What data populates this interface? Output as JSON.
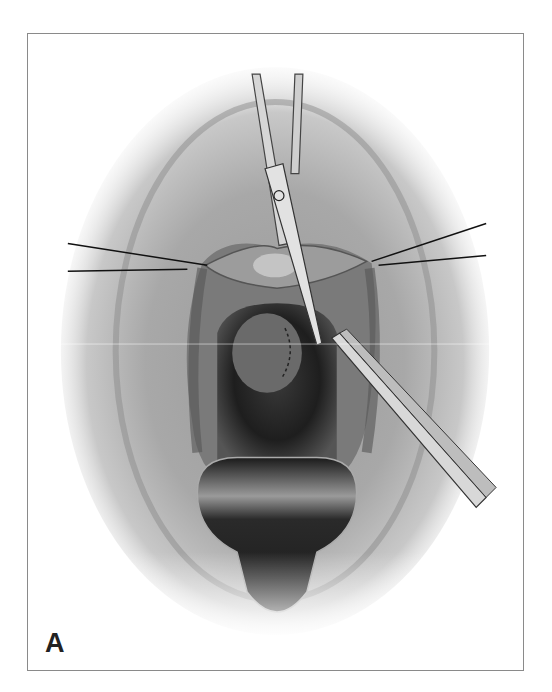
{
  "figure": {
    "panel_label": "A",
    "elements": [
      "scissors",
      "forceps",
      "left-retraction-sutures",
      "right-retraction-sutures",
      "speculum-blade",
      "dashed-incision-line"
    ],
    "colors": {
      "frame_border": "#8a8a8a",
      "label": "#222222",
      "background": "#ffffff"
    }
  }
}
